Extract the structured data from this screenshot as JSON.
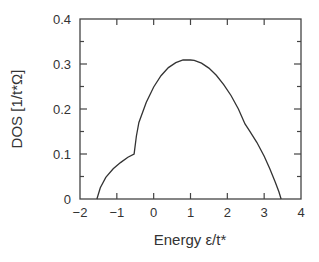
{
  "chart_data": {
    "type": "line",
    "title": "",
    "xlabel": "Energy ε/t*",
    "ylabel": "DOS [1/t*Ω]",
    "xlim": [
      -2,
      4
    ],
    "ylim": [
      0,
      0.4
    ],
    "xticks": [
      -2,
      -1,
      0,
      1,
      2,
      3,
      4
    ],
    "xtick_labels": [
      "−2",
      "−1",
      "0",
      "1",
      "2",
      "3",
      "4"
    ],
    "yticks": [
      0,
      0.1,
      0.2,
      0.3,
      0.4
    ],
    "ytick_labels": [
      "0",
      "0.1",
      "0.2",
      "0.3",
      "0.4"
    ],
    "grid": false,
    "legend": null,
    "series": [
      {
        "name": "DOS",
        "color": "#333333",
        "x": [
          -1.54,
          -1.45,
          -1.3,
          -1.1,
          -0.9,
          -0.7,
          -0.53,
          -0.47,
          -0.4,
          -0.2,
          0.0,
          0.2,
          0.4,
          0.6,
          0.8,
          1.0,
          1.1,
          1.3,
          1.5,
          1.7,
          1.9,
          2.1,
          2.3,
          2.48,
          2.6,
          2.8,
          3.0,
          3.15,
          3.3,
          3.4,
          3.46
        ],
        "y": [
          0.0,
          0.025,
          0.048,
          0.067,
          0.081,
          0.093,
          0.1,
          0.14,
          0.17,
          0.215,
          0.249,
          0.274,
          0.292,
          0.303,
          0.309,
          0.309,
          0.308,
          0.302,
          0.291,
          0.275,
          0.254,
          0.23,
          0.2,
          0.167,
          0.152,
          0.126,
          0.095,
          0.068,
          0.038,
          0.016,
          0.0
        ]
      }
    ]
  }
}
